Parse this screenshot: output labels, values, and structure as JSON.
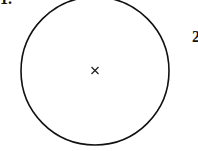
{
  "figure": {
    "question_number_left": "1.",
    "question_number_right": "2",
    "center_mark": "×",
    "circle": {
      "cx": 95,
      "cy": 71,
      "r": 74,
      "stroke": "#111111"
    }
  }
}
